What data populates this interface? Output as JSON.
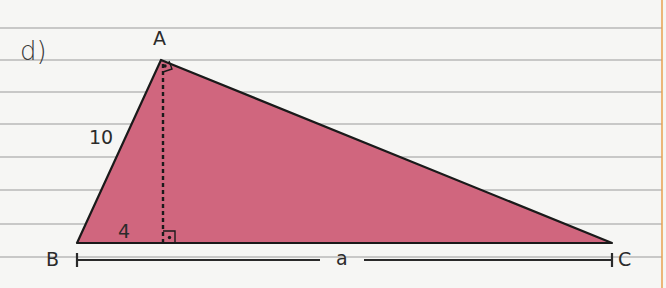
{
  "exercise": {
    "label": "d)"
  },
  "triangle": {
    "vertices": {
      "A": {
        "label": "A",
        "x": 161,
        "y": 60
      },
      "B": {
        "label": "B",
        "x": 77,
        "y": 243
      },
      "C": {
        "label": "C",
        "x": 612,
        "y": 243
      }
    },
    "altitude_foot": {
      "x": 163,
      "y": 243
    },
    "fill_color": "#d0667e",
    "stroke_color": "#1a1a1a",
    "right_angle_at": [
      "A",
      "altitude_foot"
    ]
  },
  "measurements": {
    "side_AB": "10",
    "segment_B_to_foot": "4",
    "side_BC": "a"
  },
  "paper": {
    "background": "#f6f6f4",
    "rule_color": "#b8b8b8",
    "margin_color": "#e8a050",
    "rule_y": [
      28,
      60,
      92,
      124,
      157,
      190,
      224,
      257
    ]
  }
}
